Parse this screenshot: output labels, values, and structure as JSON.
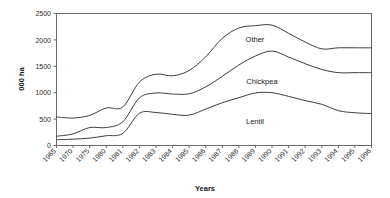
{
  "chart_data": {
    "type": "area",
    "title": "",
    "subtitle": "",
    "xlabel": "Years",
    "ylabel": "000 ha",
    "ylim": [
      0,
      2500
    ],
    "yticks": [
      0,
      500,
      1000,
      1500,
      2000,
      2500
    ],
    "grid": false,
    "legend_position": "inline-annotations",
    "stacked": true,
    "categories": [
      "1965",
      "1970",
      "1975",
      "1980",
      "1981",
      "1982",
      "1983",
      "1984",
      "1985",
      "1986",
      "1987",
      "1988",
      "1989",
      "1990",
      "1991",
      "1992",
      "1993",
      "1994",
      "1995",
      "1996"
    ],
    "series": [
      {
        "name": "Lentil",
        "values": [
          110,
          120,
          140,
          185,
          230,
          610,
          625,
          590,
          575,
          690,
          810,
          905,
          995,
          1000,
          930,
          850,
          780,
          660,
          620,
          605
        ]
      },
      {
        "name": "Chickpea",
        "values": [
          65,
          100,
          200,
          155,
          220,
          290,
          370,
          385,
          405,
          420,
          500,
          620,
          700,
          790,
          745,
          700,
          660,
          720,
          760,
          775
        ]
      },
      {
        "name": "Other",
        "values": [
          365,
          300,
          230,
          370,
          280,
          300,
          355,
          345,
          440,
          570,
          720,
          700,
          575,
          490,
          450,
          410,
          390,
          470,
          470,
          470
        ]
      }
    ],
    "cumulative_lines": [
      {
        "name": "Lentil",
        "description": "lower boundary line (Lentil only)",
        "values": [
          110,
          120,
          140,
          185,
          230,
          610,
          625,
          590,
          575,
          690,
          810,
          905,
          995,
          1000,
          930,
          850,
          780,
          660,
          620,
          605
        ]
      },
      {
        "name": "Lentil + Chickpea",
        "description": "middle boundary line",
        "values": [
          175,
          220,
          340,
          340,
          450,
          900,
          995,
          975,
          980,
          1110,
          1310,
          1525,
          1695,
          1790,
          1675,
          1550,
          1440,
          1380,
          1380,
          1380
        ]
      },
      {
        "name": "Total (Lentil + Chickpea + Other)",
        "description": "upper boundary line",
        "values": [
          540,
          520,
          570,
          710,
          730,
          1200,
          1350,
          1320,
          1420,
          1680,
          2030,
          2225,
          2270,
          2280,
          2125,
          1960,
          1830,
          1850,
          1850,
          1850
        ]
      }
    ],
    "annotations": [
      {
        "text": "Other",
        "band": "Other"
      },
      {
        "text": "Chickpea",
        "band": "Chickpea"
      },
      {
        "text": "Lentil",
        "band": "Lentil"
      }
    ]
  },
  "axes": {
    "y_title": "000 ha",
    "x_title": "Years",
    "y_tick_labels": [
      "2500",
      "2000",
      "1500",
      "1000",
      "500",
      "0"
    ],
    "x_tick_labels": [
      "1965",
      "1970",
      "1975",
      "1980",
      "1981",
      "1982",
      "1983",
      "1984",
      "1985",
      "1986",
      "1987",
      "1988",
      "1989",
      "1990",
      "1991",
      "1992",
      "1993",
      "1994",
      "1995",
      "1996"
    ]
  },
  "labels": {
    "other": "Other",
    "chickpea": "Chickpea",
    "lentil": "Lentil"
  },
  "colors": {
    "background": "#ffffff",
    "line": "#3d3d3d",
    "frame": "#6b6b6b",
    "text": "#1a1a1a",
    "tick_text": "#2b2b2b"
  }
}
